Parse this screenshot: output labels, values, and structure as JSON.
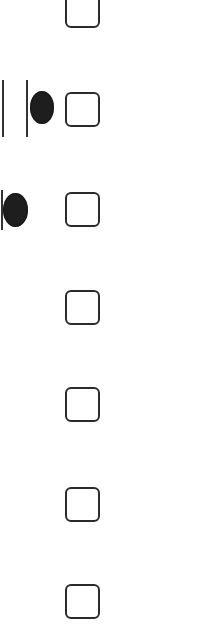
{
  "colors": {
    "background": "#ffffff",
    "checkbox_border": "#2b2b2b",
    "glyph": "#1e1e1e",
    "line": "#333333"
  },
  "rows": [
    {
      "index": 0,
      "checked": false,
      "top": -7,
      "glyphs": []
    },
    {
      "index": 1,
      "checked": false,
      "top": 92,
      "glyphs": [
        "pause-bar-left",
        "pause-bar-right",
        "record-dot"
      ]
    },
    {
      "index": 2,
      "checked": false,
      "top": 192,
      "glyphs": [
        "bar",
        "record-dot"
      ]
    },
    {
      "index": 3,
      "checked": false,
      "top": 290,
      "glyphs": []
    },
    {
      "index": 4,
      "checked": false,
      "top": 387,
      "glyphs": []
    },
    {
      "index": 5,
      "checked": false,
      "top": 487,
      "glyphs": []
    },
    {
      "index": 6,
      "checked": false,
      "top": 584,
      "glyphs": []
    }
  ]
}
